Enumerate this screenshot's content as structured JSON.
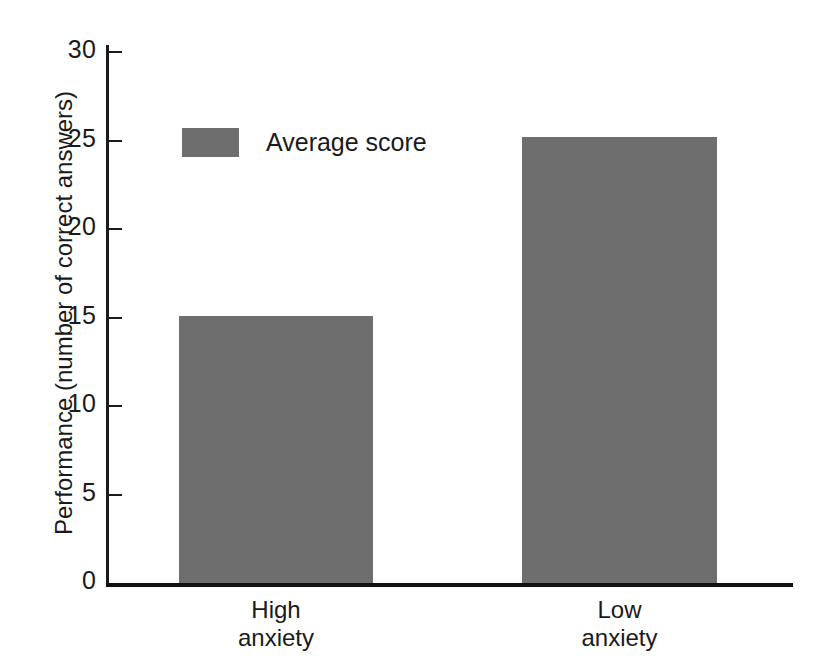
{
  "chart_data": {
    "type": "bar",
    "title": "",
    "subtitle": "",
    "xlabel": "",
    "ylabel": "Performance (number of correct answers)",
    "categories": [
      "High\nanxiety",
      "Low\nanxiety"
    ],
    "values": [
      15.1,
      25.2
    ],
    "series": [
      {
        "name": "Average score",
        "values": [
          15.1,
          25.2
        ],
        "color": "#6e6e6e"
      }
    ],
    "ylim": [
      0,
      30
    ],
    "ytick_labels": [
      "30",
      "25",
      "20",
      "15",
      "10",
      "5",
      "0"
    ],
    "ytick_values": [
      30,
      25,
      20,
      15,
      10,
      5,
      0
    ],
    "grid": false,
    "legend": {
      "position": "upper-left-inside",
      "entries": [
        {
          "label": "Average score",
          "color": "#6e6e6e"
        }
      ]
    },
    "annotations": [],
    "axis_color": "#1a1a1a",
    "background_color": "#ffffff"
  },
  "axis": {
    "ticks": [
      {
        "label": "30",
        "value": 30
      },
      {
        "label": "25",
        "value": 25
      },
      {
        "label": "20",
        "value": 20
      },
      {
        "label": "15",
        "value": 15
      },
      {
        "label": "10",
        "value": 10
      },
      {
        "label": "5",
        "value": 5
      },
      {
        "label": "0",
        "value": 0
      }
    ],
    "y_title": "Performance (number of correct answers)"
  },
  "categories": [
    {
      "line1": "High",
      "line2": "anxiety"
    },
    {
      "line1": "Low",
      "line2": "anxiety"
    }
  ],
  "legend": {
    "label": "Average score"
  }
}
